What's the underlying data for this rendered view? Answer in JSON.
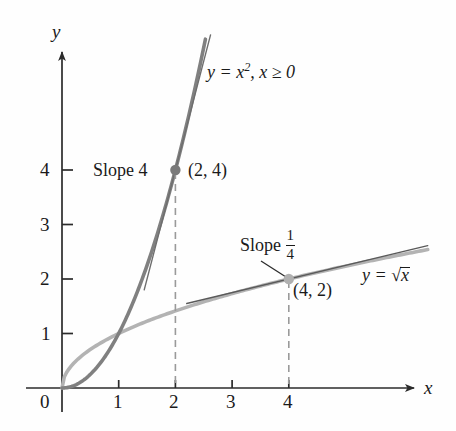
{
  "figure": {
    "axes": {
      "x_axis_label": "x",
      "y_axis_label": "y",
      "origin_label": "0",
      "x_ticks": [
        "1",
        "2",
        "3",
        "4"
      ],
      "x_tick_values": [
        1,
        2,
        3,
        4
      ],
      "y_ticks": [
        "1",
        "2",
        "3",
        "4"
      ],
      "y_tick_values": [
        1,
        2,
        3,
        4
      ],
      "xlim": [
        -0.35,
        6.5
      ],
      "ylim": [
        -0.3,
        6.3
      ],
      "origin_px": [
        62,
        388
      ],
      "x_scale_px": 56.7,
      "y_scale_px": 54.5
    },
    "colors": {
      "parabola": "#808080",
      "sqrt_curve": "#b3b3b3",
      "tangent_parabola": "#6e6e6e",
      "tangent_sqrt": "#5a5a5a",
      "axis": "#2b2b2b",
      "dashed": "#9a9a9a",
      "text": "#1a1a1a",
      "point_parabola": "#7a7a7a",
      "point_sqrt": "#b0b0b0"
    },
    "labels": {
      "parabola_eq_lhs": "y = x",
      "parabola_eq_exp": "2",
      "parabola_eq_rhs": ", x ≥ 0",
      "sqrt_eq_lhs": "y = ",
      "sqrt_eq_radicand": "x",
      "slope_parabola": "Slope 4",
      "slope_sqrt_word": "Slope",
      "slope_sqrt_num": "1",
      "slope_sqrt_den": "4",
      "point_parabola": "(2, 4)",
      "point_sqrt": "(4, 2)"
    }
  },
  "chart_data": {
    "type": "line",
    "title": "",
    "xlabel": "x",
    "ylabel": "y",
    "xlim": [
      -0.35,
      6.5
    ],
    "ylim": [
      -0.3,
      6.3
    ],
    "grid": false,
    "legend": "none",
    "xticks": [
      1,
      2,
      3,
      4
    ],
    "yticks": [
      1,
      2,
      3,
      4
    ],
    "series": [
      {
        "name": "y = x^2, x >= 0",
        "type": "curve",
        "expression": "x^2",
        "domain": [
          0,
          2.53
        ],
        "color": "#808080",
        "width": 3.6,
        "x": [
          0,
          0.25,
          0.5,
          0.75,
          1,
          1.25,
          1.5,
          1.75,
          2,
          2.25,
          2.5
        ],
        "y": [
          0,
          0.0625,
          0.25,
          0.5625,
          1,
          1.5625,
          2.25,
          3.0625,
          4,
          5.0625,
          6.25
        ]
      },
      {
        "name": "y = sqrt(x)",
        "type": "curve",
        "expression": "sqrt(x)",
        "domain": [
          0,
          6.45
        ],
        "color": "#b3b3b3",
        "width": 3.6,
        "x": [
          0,
          0.25,
          0.5,
          1,
          1.5,
          2,
          2.5,
          3,
          3.5,
          4,
          4.5,
          5,
          5.5,
          6,
          6.45
        ],
        "y": [
          0,
          0.5,
          0.707,
          1,
          1.225,
          1.414,
          1.581,
          1.732,
          1.871,
          2,
          2.121,
          2.236,
          2.345,
          2.449,
          2.54
        ]
      },
      {
        "name": "tangent to y = x^2 at (2, 4)",
        "type": "line",
        "expression": "4x - 4",
        "slope": 4,
        "point": [
          2,
          4
        ],
        "domain": [
          1.45,
          2.62
        ],
        "color": "#6e6e6e",
        "width": 1.3
      },
      {
        "name": "tangent to y = sqrt(x) at (4, 2)",
        "type": "line",
        "expression": "x/4 + 1",
        "slope": 0.25,
        "point": [
          4,
          2
        ],
        "domain": [
          2.2,
          6.45
        ],
        "color": "#5a5a5a",
        "width": 1.3
      }
    ],
    "points": [
      {
        "label": "(2, 4)",
        "x": 2,
        "y": 4,
        "annotation": "Slope 4",
        "color": "#7a7a7a"
      },
      {
        "label": "(4, 2)",
        "x": 4,
        "y": 2,
        "annotation": "Slope 1/4",
        "color": "#b0b0b0"
      }
    ],
    "dropped_lines": [
      {
        "x": 2,
        "from_y": 0,
        "to_y": 4,
        "style": "dashed"
      },
      {
        "x": 4,
        "from_y": 0,
        "to_y": 2,
        "style": "dashed"
      }
    ],
    "annotations": [
      {
        "text": "y = x^2, x >= 0",
        "x": 2.65,
        "y": 5.55
      },
      {
        "text": "y = sqrt(x)",
        "x": 5.3,
        "y": 2.05
      },
      {
        "text": "Slope 4",
        "x": 1.05,
        "y": 4.0
      },
      {
        "text": "Slope 1/4",
        "x": 3.25,
        "y": 2.95
      }
    ]
  }
}
